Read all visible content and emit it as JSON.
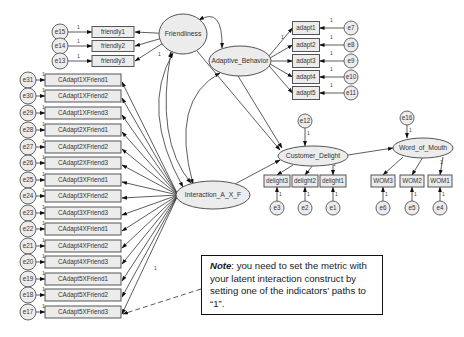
{
  "diagram": {
    "type": "SEM path diagram (AMOS)",
    "latent_variables": [
      {
        "id": "friendliness",
        "label": "Friendliness",
        "cx": 183,
        "cy": 34,
        "rx": 24,
        "ry": 20
      },
      {
        "id": "adaptive",
        "label": "Adaptive_Behavior",
        "cx": 240,
        "cy": 61,
        "rx": 31,
        "ry": 15
      },
      {
        "id": "interaction",
        "label": "Interaction_A_X_F",
        "cx": 213,
        "cy": 195,
        "rx": 37,
        "ry": 14
      },
      {
        "id": "delight",
        "label": "Customer_Delight",
        "cx": 313,
        "cy": 156,
        "rx": 35,
        "ry": 10
      },
      {
        "id": "wom",
        "label": "Word_of_Mouth",
        "cx": 423,
        "cy": 148,
        "rx": 30,
        "ry": 10
      }
    ],
    "friendliness_indicators": [
      {
        "label": "friendly1",
        "error": "e15",
        "y": 32,
        "one": "1"
      },
      {
        "label": "friendly2",
        "error": "e14",
        "y": 46,
        "one": "1"
      },
      {
        "label": "friendly3",
        "error": "e13",
        "y": 61,
        "one": "1"
      }
    ],
    "adaptive_indicators": [
      {
        "label": "adapt1",
        "error": "e7",
        "y": 28
      },
      {
        "label": "adapt2",
        "error": "e8",
        "y": 45
      },
      {
        "label": "adapt3",
        "error": "e9",
        "y": 61
      },
      {
        "label": "adapt4",
        "error": "e10",
        "y": 77
      },
      {
        "label": "adapt5",
        "error": "e11",
        "y": 93
      }
    ],
    "interaction_indicators": [
      {
        "label": "CAdapt1XFriend1",
        "error": "e31",
        "y": 80
      },
      {
        "label": "CAdapt1XFriend2",
        "error": "e30",
        "y": 96
      },
      {
        "label": "CAdapt1XFriend3",
        "error": "e29",
        "y": 113
      },
      {
        "label": "CAdapt2XFriend1",
        "error": "e28",
        "y": 130
      },
      {
        "label": "CAdapt2XFriend2",
        "error": "e27",
        "y": 147
      },
      {
        "label": "CAdapt2XFriend3",
        "error": "e26",
        "y": 163
      },
      {
        "label": "CAdapt3XFriend1",
        "error": "e25",
        "y": 180
      },
      {
        "label": "CAdapt3XFriend2",
        "error": "e24",
        "y": 196
      },
      {
        "label": "CAdapt3XFriend3",
        "error": "e23",
        "y": 213
      },
      {
        "label": "CAdapt4XFriend1",
        "error": "e22",
        "y": 229
      },
      {
        "label": "CAdapt4XFriend2",
        "error": "e21",
        "y": 246
      },
      {
        "label": "CAdapt4XFriend3",
        "error": "e20",
        "y": 262
      },
      {
        "label": "CAdapt5XFriend1",
        "error": "e19",
        "y": 279
      },
      {
        "label": "CAdapt5XFriend2",
        "error": "e18",
        "y": 295
      },
      {
        "label": "CAdapt5XFriend3",
        "error": "e17",
        "y": 312
      }
    ],
    "delight_indicators": [
      {
        "label": "delight3",
        "error": "e3",
        "x": 277
      },
      {
        "label": "delight2",
        "error": "e2",
        "x": 305
      },
      {
        "label": "delight1",
        "error": "e1",
        "x": 333
      }
    ],
    "wom_indicators": [
      {
        "label": "WOM3",
        "error": "e6",
        "x": 383
      },
      {
        "label": "WOM2",
        "error": "e5",
        "x": 412
      },
      {
        "label": "WOM1",
        "error": "e4",
        "x": 440
      }
    ],
    "disturbances": [
      {
        "label": "e12",
        "target": "delight",
        "cx": 305,
        "cy": 121
      },
      {
        "label": "e16",
        "target": "wom",
        "cx": 407,
        "cy": 118
      }
    ],
    "fixed_path_label": "1"
  },
  "note": {
    "bold_prefix": "Note",
    "text": ": you need to set the metric with your latent interaction construct by setting one of the indicators’ paths to “1”."
  },
  "colors": {
    "node_fill": "#ececec",
    "node_stroke": "#555555",
    "line": "#333333",
    "note_border": "#111111"
  }
}
